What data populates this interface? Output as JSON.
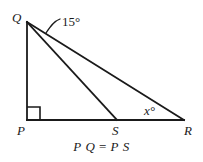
{
  "figure": {
    "caption": "P Q = P S",
    "caption_parts": {
      "left_first": "P",
      "left_second": "Q",
      "equals": "=",
      "right_first": "P",
      "right_second": "S"
    },
    "vertices": [
      {
        "id": "Q",
        "label": "Q",
        "x": 27,
        "y": 22,
        "label_x": 12,
        "label_y": 11
      },
      {
        "id": "P",
        "label": "P",
        "x": 27,
        "y": 120,
        "label_x": 17,
        "label_y": 124
      },
      {
        "id": "S",
        "label": "S",
        "x": 117,
        "y": 120,
        "label_x": 112,
        "label_y": 124
      },
      {
        "id": "R",
        "label": "R",
        "x": 184,
        "y": 120,
        "label_x": 184,
        "label_y": 124
      }
    ],
    "segments": [
      {
        "name": "QP",
        "from": "Q",
        "to": "P"
      },
      {
        "name": "PR",
        "from": "P",
        "to": "R"
      },
      {
        "name": "QS",
        "from": "Q",
        "to": "S"
      },
      {
        "name": "QR",
        "from": "Q",
        "to": "R"
      }
    ],
    "angles": [
      {
        "name": "angle-SQR",
        "value": "15",
        "unit": "°",
        "text": "15°",
        "at_vertex": "Q",
        "label_x": 62,
        "label_y": 15
      },
      {
        "name": "angle-QRS",
        "value": "x",
        "unit": "°",
        "text": "x°",
        "at_vertex": "R",
        "label_x": 144,
        "label_y": 104
      }
    ],
    "right_angle": {
      "name": "right-angle-at-P",
      "at_vertex": "P",
      "size": 13
    },
    "style": {
      "stroke": "#1a1a1a",
      "background": "#ffffff",
      "stroke_width": 1.6
    }
  }
}
